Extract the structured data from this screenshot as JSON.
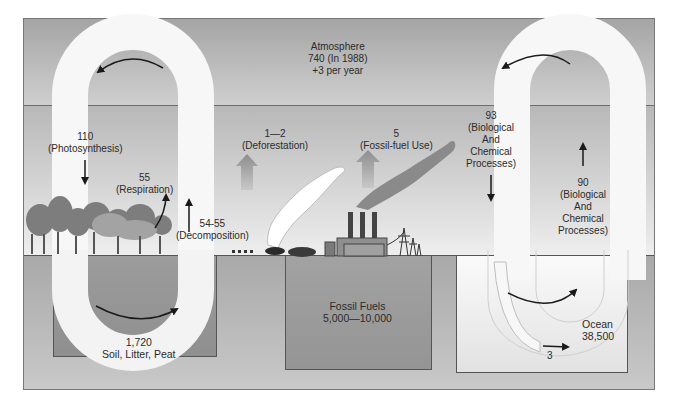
{
  "diagram": {
    "type": "carbon-cycle",
    "colors": {
      "atmosphere": "#b5b5b5",
      "loop": "#f7f7f7",
      "soil": "#959595",
      "fossil": "#9c9c9c",
      "ocean": "#f0f0f0",
      "arrow": "#1a1a1a",
      "plume_dark": "#8a8a8a",
      "plume_light": "#ffffff"
    },
    "reservoirs": {
      "atmosphere": {
        "name": "Atmosphere",
        "value": "740 (In 1988)",
        "change": "+3 per year"
      },
      "soil": {
        "value": "1,720",
        "name": "Soil, Litter, Peat"
      },
      "fossil": {
        "name": "Fossil Fuels",
        "value": "5,000—10,000"
      },
      "ocean": {
        "name": "Ocean",
        "value": "38,500"
      }
    },
    "fluxes": {
      "photosynthesis": {
        "value": "110",
        "label": "(Photosynthesis)"
      },
      "respiration": {
        "value": "55",
        "label": "(Respiration)"
      },
      "decomposition": {
        "value": "54-55",
        "label": "(Decomposition)"
      },
      "deforestation": {
        "value": "1—2",
        "label": "(Deforestation)"
      },
      "fossil_fuel_use": {
        "value": "5",
        "label": "(Fossil-fuel Use)"
      },
      "ocean_uptake": {
        "value": "93",
        "line1": "(Biological",
        "line2": "And",
        "line3": "Chemical",
        "line4": "Processes)"
      },
      "ocean_release": {
        "value": "90",
        "line1": "(Biological",
        "line2": "And",
        "line3": "Chemical",
        "line4": "Processes)"
      },
      "sediment": {
        "value": "3"
      }
    }
  }
}
